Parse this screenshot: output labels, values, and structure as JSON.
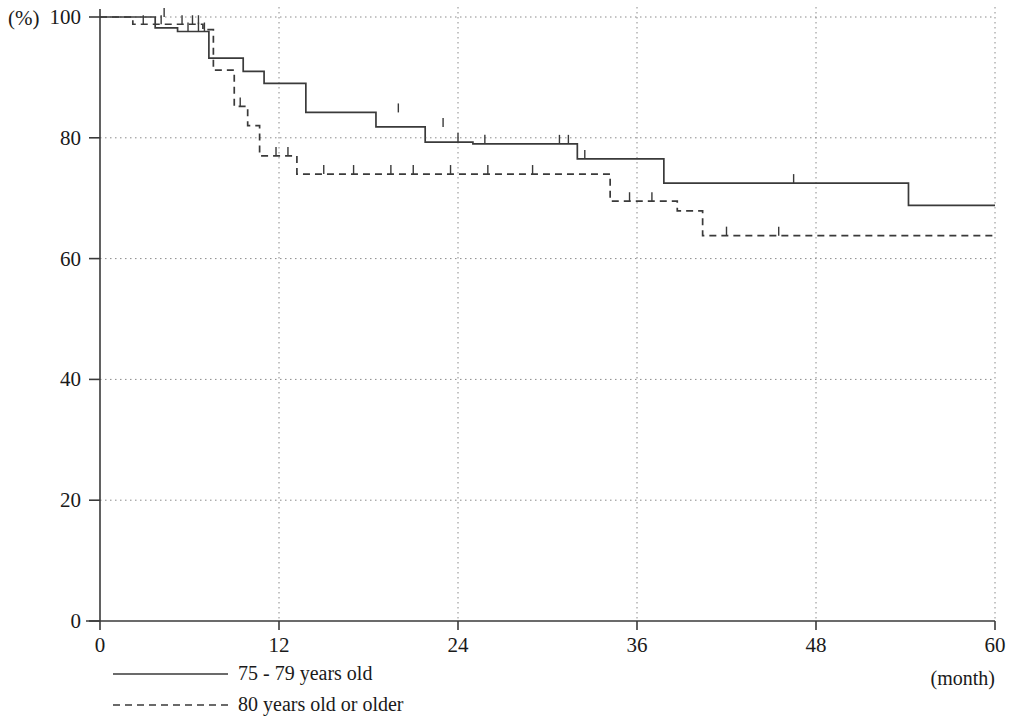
{
  "chart_data": {
    "type": "line",
    "title": "",
    "subtitle": "",
    "xlabel": "(month)",
    "ylabel": "(%)",
    "xlim": [
      0,
      60
    ],
    "ylim": [
      0,
      100
    ],
    "xticks": [
      0,
      12,
      24,
      36,
      48,
      60
    ],
    "xtick_labels": [
      "0",
      "12",
      "24",
      "36",
      "48",
      "60"
    ],
    "yticks": [
      0,
      20,
      40,
      60,
      80,
      100
    ],
    "ytick_labels": [
      "0",
      "20",
      "40",
      "60",
      "80",
      "100"
    ],
    "grid": true,
    "grid_style": "dotted",
    "legend_position": "below-left",
    "curve_style": "kaplan-meier step",
    "series": [
      {
        "name": "75 - 79 years old",
        "line_style": "solid",
        "color": "#3a3a3a",
        "steps": [
          [
            0,
            100
          ],
          [
            3.7,
            100
          ],
          [
            3.7,
            98.2
          ],
          [
            5.2,
            98.2
          ],
          [
            5.2,
            97.6
          ],
          [
            7.3,
            97.6
          ],
          [
            7.3,
            93.2
          ],
          [
            9.6,
            93.2
          ],
          [
            9.6,
            91.0
          ],
          [
            11.0,
            91.0
          ],
          [
            11.0,
            89.0
          ],
          [
            13.8,
            89.0
          ],
          [
            13.8,
            84.2
          ],
          [
            18.5,
            84.2
          ],
          [
            18.5,
            81.8
          ],
          [
            21.8,
            81.8
          ],
          [
            21.8,
            79.3
          ],
          [
            25.0,
            79.3
          ],
          [
            25.0,
            79.0
          ],
          [
            32.0,
            79.0
          ],
          [
            32.0,
            76.5
          ],
          [
            37.8,
            76.5
          ],
          [
            37.8,
            72.5
          ],
          [
            54.2,
            72.5
          ],
          [
            54.2,
            68.8
          ],
          [
            60,
            68.8
          ]
        ],
        "censor_marks": [
          [
            4.3,
            100
          ],
          [
            5.9,
            97.6
          ],
          [
            6.6,
            97.6
          ],
          [
            7.0,
            97.6
          ],
          [
            20.0,
            84.2
          ],
          [
            23.0,
            81.8
          ],
          [
            24.0,
            79.3
          ],
          [
            25.8,
            79.0
          ],
          [
            30.8,
            79.0
          ],
          [
            31.4,
            79.0
          ],
          [
            32.5,
            76.5
          ],
          [
            46.5,
            72.5
          ]
        ],
        "endpoint_value": 68.8
      },
      {
        "name": "80 years old or older",
        "line_style": "dashed",
        "color": "#3a3a3a",
        "steps": [
          [
            0,
            100
          ],
          [
            2.2,
            100
          ],
          [
            2.2,
            98.8
          ],
          [
            6.9,
            98.8
          ],
          [
            6.9,
            97.9
          ],
          [
            7.6,
            97.9
          ],
          [
            7.6,
            91.2
          ],
          [
            9.0,
            91.2
          ],
          [
            9.0,
            85.2
          ],
          [
            9.9,
            85.2
          ],
          [
            9.9,
            82.0
          ],
          [
            10.7,
            82.0
          ],
          [
            10.7,
            77.0
          ],
          [
            13.2,
            77.0
          ],
          [
            13.2,
            74.0
          ],
          [
            34.2,
            74.0
          ],
          [
            34.2,
            69.5
          ],
          [
            38.7,
            69.5
          ],
          [
            38.7,
            67.9
          ],
          [
            40.4,
            67.9
          ],
          [
            40.4,
            63.8
          ],
          [
            60,
            63.8
          ]
        ],
        "censor_marks": [
          [
            2.9,
            98.8
          ],
          [
            4.1,
            98.8
          ],
          [
            5.5,
            98.8
          ],
          [
            6.2,
            98.8
          ],
          [
            6.6,
            98.8
          ],
          [
            9.4,
            85.2
          ],
          [
            11.8,
            77.0
          ],
          [
            12.6,
            77.0
          ],
          [
            15.0,
            74.0
          ],
          [
            17.0,
            74.0
          ],
          [
            19.5,
            74.0
          ],
          [
            21.0,
            74.0
          ],
          [
            23.5,
            74.0
          ],
          [
            26.0,
            74.0
          ],
          [
            29.0,
            74.0
          ],
          [
            35.5,
            69.5
          ],
          [
            37.0,
            69.5
          ],
          [
            42.0,
            63.8
          ],
          [
            45.5,
            63.8
          ]
        ],
        "endpoint_value": 63.8
      }
    ]
  },
  "legend": {
    "items": [
      {
        "label": "75 - 79 years old",
        "style": "solid"
      },
      {
        "label": "80 years old or older",
        "style": "dashed"
      }
    ]
  },
  "axes": {
    "y_unit_label": "(%)",
    "x_unit_label": "(month)"
  }
}
